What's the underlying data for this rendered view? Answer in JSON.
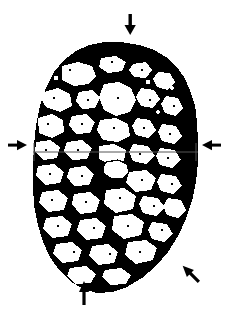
{
  "caption": {
    "text": "radiographic appearance of the fractured specimen",
    "visible_state": "clipped-at-top-edge"
  },
  "figure": {
    "background_color": "#ffffff",
    "foreground_color": "#000000",
    "rendering": "high-contrast thresholded black and white",
    "specimen": {
      "name": "mottled rounded mass",
      "bounds": {
        "left": 33,
        "top": 42,
        "right": 198,
        "bottom": 296
      },
      "description": "roughly octagonal outline with speckled interior of black patches and white voids"
    },
    "measurement_line": {
      "name": "horizontal reference line",
      "y": 152,
      "x_start": 33,
      "x_end": 198,
      "color": "#555555",
      "end_ticks": true,
      "tick_half_height": 9
    },
    "inner_marker": {
      "name": "outlined white lesion",
      "cx": 114,
      "cy": 170,
      "description": "small irregular white region outlined in black just below the reference line"
    },
    "annotations": [
      {
        "id": "arrow-top",
        "label": "top marker",
        "direction": "down",
        "x": 131,
        "y": 24,
        "glyph": "arrow-down-icon"
      },
      {
        "id": "arrow-left",
        "label": "left margin marker",
        "direction": "right",
        "x": 17,
        "y": 145,
        "glyph": "arrow-right-icon"
      },
      {
        "id": "arrow-right",
        "label": "right margin marker",
        "direction": "left",
        "x": 212,
        "y": 145,
        "glyph": "arrow-left-icon"
      },
      {
        "id": "arrow-bottom-left",
        "label": "lower marker",
        "direction": "up",
        "x": 84,
        "y": 292,
        "glyph": "arrow-up-icon"
      },
      {
        "id": "arrow-bottom-right",
        "label": "lower right marker",
        "direction": "up-left",
        "x": 189,
        "y": 272,
        "glyph": "arrow-up-left-icon"
      }
    ]
  }
}
